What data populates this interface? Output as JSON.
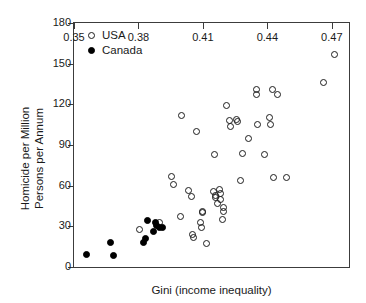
{
  "chart_data": {
    "type": "scatter",
    "title": "",
    "xlabel": "Gini (income inequality)",
    "ylabel_lines": [
      "Homicide per Million",
      "Persons per Annum"
    ],
    "xlim": [
      0.35,
      0.478
    ],
    "ylim": [
      0,
      180
    ],
    "xticks": [
      0.35,
      0.38,
      0.41,
      0.44,
      0.47
    ],
    "xtick_labels": [
      "0.35",
      "0.38",
      "0.41",
      "0.44",
      "0.47"
    ],
    "yticks": [
      0,
      30,
      60,
      90,
      120,
      150,
      180
    ],
    "ytick_labels": [
      "0",
      "30",
      "60",
      "90",
      "120",
      "150",
      "180"
    ],
    "grid": false,
    "legend_position": "top-left",
    "marker_colors": {
      "usa_edge": "#1c1c1c",
      "usa_fill": "none",
      "canada_fill": "#000000"
    },
    "series": [
      {
        "name": "USA",
        "marker": "open-circle",
        "points": [
          [
            0.3806,
            27.5
          ],
          [
            0.3898,
            33.0
          ],
          [
            0.3956,
            67.0
          ],
          [
            0.3962,
            60.5
          ],
          [
            0.3994,
            37.0
          ],
          [
            0.4,
            112.0
          ],
          [
            0.4032,
            56.5
          ],
          [
            0.4046,
            52.0
          ],
          [
            0.4052,
            24.0
          ],
          [
            0.4056,
            22.0
          ],
          [
            0.407,
            100.0
          ],
          [
            0.4088,
            33.0
          ],
          [
            0.4092,
            29.0
          ],
          [
            0.4098,
            41.0
          ],
          [
            0.41,
            40.0
          ],
          [
            0.4118,
            17.0
          ],
          [
            0.4148,
            55.5
          ],
          [
            0.4152,
            83.0
          ],
          [
            0.4158,
            51.0
          ],
          [
            0.416,
            53.0
          ],
          [
            0.4166,
            47.0
          ],
          [
            0.4178,
            57.0
          ],
          [
            0.418,
            54.0
          ],
          [
            0.4184,
            50.0
          ],
          [
            0.419,
            35.0
          ],
          [
            0.4196,
            44.0
          ],
          [
            0.4198,
            41.0
          ],
          [
            0.4212,
            119.0
          ],
          [
            0.4226,
            108.0
          ],
          [
            0.423,
            104.0
          ],
          [
            0.4256,
            109.0
          ],
          [
            0.4262,
            107.0
          ],
          [
            0.4274,
            64.0
          ],
          [
            0.4286,
            84.0
          ],
          [
            0.431,
            95.0
          ],
          [
            0.4348,
            131.0
          ],
          [
            0.435,
            127.0
          ],
          [
            0.4356,
            105.0
          ],
          [
            0.4386,
            83.0
          ],
          [
            0.441,
            110.0
          ],
          [
            0.4414,
            105.0
          ],
          [
            0.4422,
            131.0
          ],
          [
            0.4428,
            66.0
          ],
          [
            0.4446,
            127.0
          ],
          [
            0.449,
            66.0
          ],
          [
            0.4662,
            136.0
          ],
          [
            0.4712,
            157.0
          ]
        ]
      },
      {
        "name": "Canada",
        "marker": "filled-circle",
        "points": [
          [
            0.356,
            9.0
          ],
          [
            0.367,
            18.0
          ],
          [
            0.3682,
            8.5
          ],
          [
            0.3824,
            18.0
          ],
          [
            0.3832,
            21.0
          ],
          [
            0.384,
            34.0
          ],
          [
            0.387,
            26.0
          ],
          [
            0.3878,
            32.5
          ],
          [
            0.3886,
            30.5
          ],
          [
            0.39,
            29.0
          ],
          [
            0.3912,
            29.5
          ]
        ]
      }
    ]
  },
  "legend": {
    "items": [
      {
        "label": "USA",
        "marker": "open-circle"
      },
      {
        "label": "Canada",
        "marker": "filled-circle"
      }
    ]
  }
}
